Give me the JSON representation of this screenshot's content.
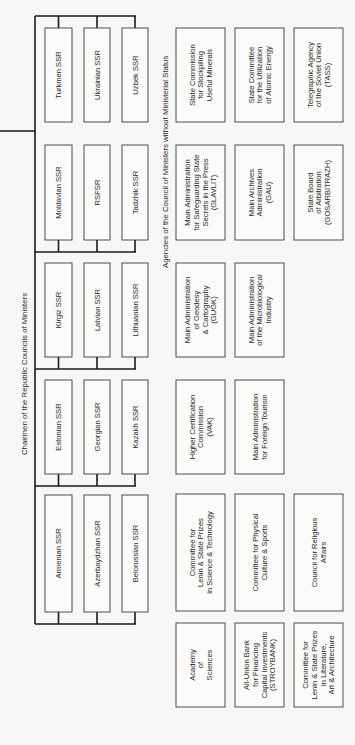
{
  "headings": {
    "republics": "Chairmen of the Republic Councils of Ministers",
    "agencies": "Agencies of the Council of Ministers without Ministerial Status"
  },
  "republic_groups": [
    [
      "Turkmen SSR",
      "Ukrainian SSR",
      "Uzbek SSR"
    ],
    [
      "Moldavian SSR",
      "RSFSR",
      "Tadzhik SSR"
    ],
    [
      "Kirgiz SSR",
      "Latvian SSR",
      "Lithuanian SSR"
    ],
    [
      "Estonian SSR",
      "Georgian SSR",
      "Kazakh SSR"
    ],
    [
      "Armenian SSR",
      "Azerbaydzhan SSR",
      "Belorussian SSR"
    ]
  ],
  "agency_rows": [
    [
      [
        "State Commission",
        "for Stockpiling",
        "Useful Minerals"
      ],
      [
        "State Committee",
        "for the Utilization",
        "of Atomic Energy"
      ],
      [
        "Telegraphic Agency",
        "of the Soviet Union",
        "(TASS)"
      ]
    ],
    [
      [
        "Main Administration",
        "for Safeguarding State",
        "Secrets in the Press",
        "(GLAVLIT)"
      ],
      [
        "Main Archives",
        "Administration",
        "(GAU)"
      ],
      [
        "State Board",
        "of Arbitration",
        "(GOSARBITRAZH)"
      ]
    ],
    [
      [
        "Main Administration",
        "of Geodesy",
        "& Cartography",
        "(GUGK)"
      ],
      [
        "Main Administration",
        "of the Microbiological",
        "Industry"
      ]
    ],
    [
      [
        "Higher Certification",
        "Commission",
        "(VAK)"
      ],
      [
        "Main Administration",
        "for Foreign Tourism"
      ]
    ],
    [
      [
        "Committee for",
        "Lenin & State Prizes",
        "in Science & Technology"
      ],
      [
        "Committee for Physical",
        "Culture & Sports"
      ],
      [
        "Council for Religious",
        "Affairs"
      ]
    ],
    [
      [
        "Academy",
        "of",
        "Sciences"
      ],
      [
        "All-Union Bank",
        "for Financing",
        "Capital Investments",
        "(STROYBANK)"
      ],
      [
        "Committee for",
        "Lenin & State Prizes",
        "In Literature,",
        "Art & Architecture"
      ]
    ]
  ]
}
